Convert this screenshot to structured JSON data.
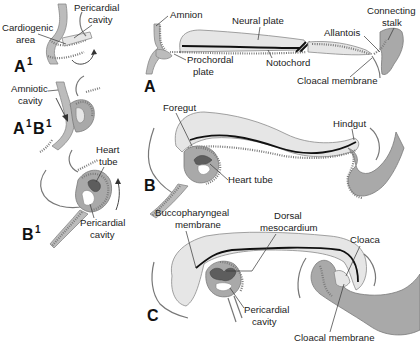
{
  "figure": {
    "type": "embryology-diagram",
    "colors": {
      "ectoderm": "#bcbcbc",
      "mesoderm": "#a9a9a9",
      "endoderm": "#e6e6e6",
      "heart_tube": "#5d5d5d",
      "notochord": "#111111",
      "label_text": "#222222"
    }
  },
  "panels": {
    "A1": {
      "letter": "A",
      "sup": "1",
      "labels": {
        "pericardial_cavity": [
          "Pericardial",
          "cavity"
        ],
        "cardiogenic_area": [
          "Cardiogenic",
          "area"
        ]
      }
    },
    "A1B1": {
      "letter_a": "A",
      "sup_a": "1",
      "letter_b": "B",
      "sup_b": "1",
      "labels": {
        "amniotic_cavity": [
          "Amniotic",
          "cavity"
        ]
      }
    },
    "B1": {
      "letter": "B",
      "sup": "1",
      "labels": {
        "heart_tube": [
          "Heart",
          "tube"
        ],
        "pericardial_cavity": [
          "Pericardial",
          "cavity"
        ]
      }
    },
    "A": {
      "letter": "A",
      "labels": {
        "amnion": "Amnion",
        "neural_plate": "Neural plate",
        "connecting_stalk": [
          "Connecting",
          "stalk"
        ],
        "allantois": "Allantois",
        "prochordal_plate": [
          "Prochordal",
          "plate"
        ],
        "notochord": "Notochord",
        "cloacal_membrane": "Cloacal membrane"
      }
    },
    "B": {
      "letter": "B",
      "labels": {
        "foregut": "Foregut",
        "hindgut": "Hindgut",
        "heart_tube": "Heart tube"
      }
    },
    "C": {
      "letter": "C",
      "labels": {
        "buccopharyngeal_membrane": [
          "Buccopharyngeal",
          "membrane"
        ],
        "dorsal_mesocardium": [
          "Dorsal",
          "mesocardium"
        ],
        "cloaca": "Cloaca",
        "pericardial_cavity": [
          "Pericardial",
          "cavity"
        ],
        "cloacal_membrane": "Cloacal membrane"
      }
    }
  }
}
